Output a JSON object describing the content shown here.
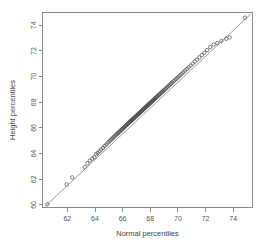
{
  "chart_data": {
    "type": "scatter",
    "title": "",
    "subtitle": "",
    "xlabel": "Normal percentiles",
    "ylabel": "Height percentiles",
    "xlim": [
      60.2,
      75.4
    ],
    "ylim": [
      59.8,
      75.0
    ],
    "xticks": [
      62,
      64,
      66,
      68,
      70,
      72,
      74
    ],
    "yticks": [
      60,
      62,
      64,
      66,
      68,
      70,
      72,
      74
    ],
    "xticklabels": [
      "62",
      "64",
      "66",
      "68",
      "70",
      "72",
      "74"
    ],
    "yticklabels": [
      "60",
      "62",
      "64",
      "66",
      "68",
      "70",
      "72",
      "74"
    ],
    "grid": false,
    "legend": null,
    "annotations": [],
    "marker": "open-circle",
    "reference_line": {
      "name": "qq-reference-line",
      "x": [
        60.4,
        75.3
      ],
      "y": [
        59.9,
        74.9
      ],
      "slope": 1.0,
      "intercept": -0.45
    },
    "series": [
      {
        "name": "height-vs-normal-quantiles",
        "x": [
          60.55,
          61.95,
          62.35,
          63.25,
          63.45,
          63.62,
          63.8,
          63.95,
          64.08,
          64.2,
          64.32,
          64.45,
          64.58,
          64.7,
          64.82,
          64.93,
          65.03,
          65.12,
          65.2,
          65.28,
          65.35,
          65.42,
          65.49,
          65.56,
          65.62,
          65.68,
          65.74,
          65.8,
          65.86,
          65.92,
          65.97,
          66.02,
          66.07,
          66.12,
          66.17,
          66.22,
          66.27,
          66.32,
          66.37,
          66.42,
          66.47,
          66.52,
          66.56,
          66.6,
          66.64,
          66.68,
          66.72,
          66.76,
          66.8,
          66.84,
          66.88,
          66.92,
          66.96,
          67.0,
          67.04,
          67.08,
          67.12,
          67.16,
          67.2,
          67.24,
          67.28,
          67.32,
          67.36,
          67.4,
          67.44,
          67.48,
          67.52,
          67.56,
          67.6,
          67.64,
          67.68,
          67.72,
          67.76,
          67.8,
          67.84,
          67.88,
          67.92,
          67.96,
          68.0,
          68.04,
          68.08,
          68.12,
          68.16,
          68.2,
          68.24,
          68.28,
          68.33,
          68.38,
          68.43,
          68.48,
          68.53,
          68.58,
          68.63,
          68.68,
          68.74,
          68.8,
          68.86,
          68.92,
          68.98,
          69.05,
          69.12,
          69.19,
          69.26,
          69.34,
          69.42,
          69.5,
          69.58,
          69.67,
          69.76,
          69.86,
          69.96,
          70.06,
          70.17,
          70.28,
          70.4,
          70.52,
          70.65,
          70.78,
          70.92,
          71.07,
          71.22,
          71.38,
          71.55,
          71.73,
          71.92,
          72.12,
          72.34,
          72.58,
          72.85,
          73.15,
          73.5,
          73.75,
          74.85
        ],
        "y": [
          60.05,
          61.6,
          62.15,
          62.95,
          63.25,
          63.45,
          63.6,
          63.72,
          63.95,
          64.05,
          64.18,
          64.32,
          64.45,
          64.6,
          64.72,
          64.85,
          64.95,
          65.05,
          65.12,
          65.2,
          65.28,
          65.35,
          65.42,
          65.5,
          65.56,
          65.62,
          65.68,
          65.74,
          65.8,
          65.86,
          65.92,
          65.97,
          66.02,
          66.07,
          66.12,
          66.17,
          66.22,
          66.27,
          66.32,
          66.37,
          66.42,
          66.47,
          66.51,
          66.55,
          66.59,
          66.63,
          66.67,
          66.71,
          66.75,
          66.79,
          66.83,
          66.87,
          66.91,
          66.95,
          66.99,
          67.03,
          67.07,
          67.11,
          67.15,
          67.19,
          67.23,
          67.27,
          67.31,
          67.35,
          67.39,
          67.43,
          67.47,
          67.51,
          67.55,
          67.59,
          67.63,
          67.67,
          67.71,
          67.75,
          67.79,
          67.83,
          67.87,
          67.91,
          67.95,
          67.99,
          68.03,
          68.07,
          68.11,
          68.15,
          68.19,
          68.23,
          68.28,
          68.33,
          68.38,
          68.43,
          68.48,
          68.53,
          68.58,
          68.63,
          68.69,
          68.75,
          68.81,
          68.87,
          68.93,
          69.0,
          69.07,
          69.14,
          69.21,
          69.29,
          69.37,
          69.45,
          69.53,
          69.62,
          69.71,
          69.81,
          69.91,
          70.01,
          70.12,
          70.23,
          70.35,
          70.47,
          70.6,
          70.73,
          70.87,
          71.02,
          71.17,
          71.33,
          71.5,
          71.68,
          71.87,
          72.07,
          72.3,
          72.5,
          72.62,
          72.78,
          72.95,
          73.05,
          74.6
        ]
      }
    ]
  },
  "axes": {
    "x_title": "Normal percentiles",
    "y_title": "Height percentiles"
  }
}
